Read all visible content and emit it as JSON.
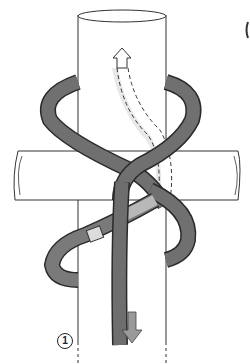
{
  "diagram": {
    "type": "knot-lashing-illustration",
    "elements": {
      "vertical_pole": "upright pole (cylinder)",
      "horizontal_pole": "crossbar pole",
      "rope": "dark grey rope wrapped diagonally around both poles",
      "hidden_path": "dashed rope path behind pole",
      "arrow_up": "hollow up arrow indicating rope exit direction",
      "arrow_down": "grey down arrow indicating rope working end",
      "whipping": "light band marking on rope"
    },
    "step_label": "1",
    "colors": {
      "rope": "#6e6e6e",
      "rope_outline": "#2a2a2a",
      "rope_light": "#c8c8c8",
      "pole_outline": "#333333",
      "background": "#ffffff"
    }
  }
}
